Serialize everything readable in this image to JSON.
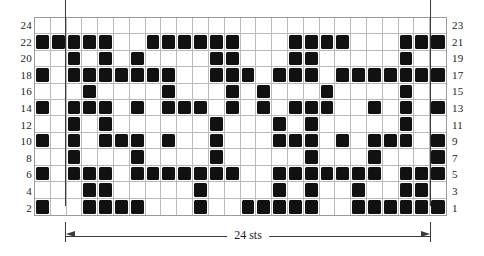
{
  "chart_data": {
    "type": "heatmap",
    "title": "",
    "xlabel": "24 sts",
    "ylabel": "",
    "grid": true,
    "legend": "none",
    "columns": 26,
    "grid_rows": 12,
    "pattern_rows": 24,
    "repeat_marker_columns": [
      2,
      25
    ],
    "row_labels_left": [
      "24",
      "22",
      "20",
      "18",
      "16",
      "14",
      "12",
      "10",
      "8",
      "6",
      "4",
      "2"
    ],
    "row_labels_right": [
      "23",
      "21",
      "19",
      "17",
      "15",
      "13",
      "11",
      "9",
      "7",
      "5",
      "3",
      "1"
    ],
    "cell_filled_color": "#111111",
    "gridline_color": "#b9b9b9",
    "border_color": "#9a9a9a",
    "marker_color": "#3a3a3a",
    "background_color": "#ffffff",
    "rows": [
      {
        "label_left": "24",
        "label_right": "23",
        "filled": []
      },
      {
        "label_left": "22",
        "label_right": "21",
        "filled": [
          1,
          2,
          3,
          4,
          5,
          8,
          9,
          10,
          11,
          12,
          13,
          17,
          18,
          19,
          20,
          24,
          25,
          26
        ]
      },
      {
        "label_left": "20",
        "label_right": "19",
        "filled": [
          3,
          5,
          7,
          12,
          13,
          17,
          18,
          24
        ]
      },
      {
        "label_left": "18",
        "label_right": "17",
        "filled": [
          1,
          3,
          4,
          5,
          6,
          7,
          8,
          9,
          12,
          13,
          14,
          16,
          17,
          18,
          20,
          21,
          22,
          23,
          24,
          25,
          26
        ]
      },
      {
        "label_left": "16",
        "label_right": "15",
        "filled": [
          4,
          9,
          13,
          15,
          19,
          24
        ]
      },
      {
        "label_left": "14",
        "label_right": "13",
        "filled": [
          1,
          3,
          4,
          5,
          7,
          9,
          10,
          11,
          13,
          15,
          17,
          18,
          19,
          22,
          24,
          26
        ]
      },
      {
        "label_left": "12",
        "label_right": "11",
        "filled": [
          3,
          5,
          12,
          16,
          18,
          24
        ]
      },
      {
        "label_left": "10",
        "label_right": "9",
        "filled": [
          1,
          3,
          5,
          6,
          7,
          9,
          12,
          16,
          17,
          18,
          20,
          22,
          23,
          24,
          26
        ]
      },
      {
        "label_left": "8",
        "label_right": "7",
        "filled": [
          3,
          7,
          12,
          18,
          22,
          26
        ]
      },
      {
        "label_left": "6",
        "label_right": "5",
        "filled": [
          1,
          3,
          4,
          5,
          7,
          8,
          9,
          10,
          11,
          12,
          13,
          16,
          17,
          18,
          19,
          20,
          21,
          22,
          24,
          25,
          26
        ]
      },
      {
        "label_left": "4",
        "label_right": "3",
        "filled": [
          4,
          5,
          11,
          16,
          18,
          21,
          24,
          25
        ]
      },
      {
        "label_left": "2",
        "label_right": "1",
        "filled": [
          1,
          4,
          5,
          6,
          7,
          11,
          14,
          15,
          16,
          17,
          18,
          21,
          22,
          23,
          24,
          25,
          26
        ]
      }
    ]
  },
  "measure": {
    "label": "24 sts"
  }
}
